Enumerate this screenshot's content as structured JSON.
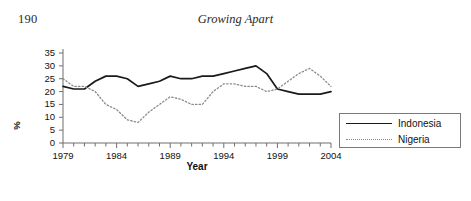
{
  "page": {
    "number": "190",
    "running_head": "Growing Apart"
  },
  "chart_data": {
    "type": "line",
    "title": "",
    "xlabel": "Year",
    "ylabel": "%",
    "xlim": [
      1979,
      2004
    ],
    "ylim": [
      0,
      35
    ],
    "ytick_values": [
      0,
      5,
      10,
      15,
      20,
      25,
      30,
      35
    ],
    "ytick_labels": [
      "0",
      "5",
      "10",
      "15",
      "20",
      "25",
      "30",
      "35"
    ],
    "xtick_labels": [
      "1979",
      "1984",
      "1989",
      "1994",
      "1999",
      "2004"
    ],
    "xtick_values": [
      1979,
      1984,
      1989,
      1994,
      1999,
      2004
    ],
    "minor_xticks_every": 1,
    "grid": false,
    "legend_position": "right",
    "x": [
      1979,
      1980,
      1981,
      1982,
      1983,
      1984,
      1985,
      1986,
      1987,
      1988,
      1989,
      1990,
      1991,
      1992,
      1993,
      1994,
      1995,
      1996,
      1997,
      1998,
      1999,
      2000,
      2001,
      2002,
      2003,
      2004
    ],
    "series": [
      {
        "name": "Indonesia",
        "style": "solid",
        "color": "#1a1a1a",
        "values": [
          22,
          21,
          21,
          24,
          26,
          26,
          25,
          22,
          23,
          24,
          26,
          25,
          25,
          26,
          26,
          27,
          28,
          29,
          30,
          27,
          21,
          20,
          19,
          19,
          19,
          20
        ]
      },
      {
        "name": "Nigeria",
        "style": "dotted",
        "color": "#8a8a8a",
        "values": [
          25,
          22,
          22,
          20,
          15,
          13,
          9,
          8,
          12,
          15,
          18,
          17,
          15,
          15,
          20,
          23,
          23,
          22,
          22,
          20,
          21,
          24,
          27,
          29,
          26,
          22
        ]
      }
    ]
  }
}
